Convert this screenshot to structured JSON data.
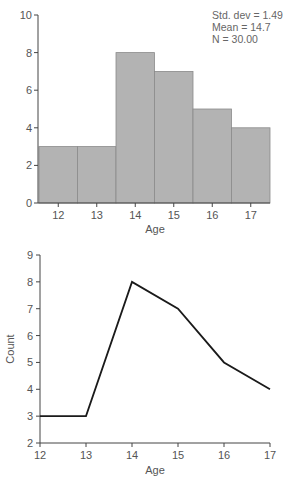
{
  "chart_data": [
    {
      "type": "bar",
      "subtype": "histogram",
      "categories": [
        "12",
        "13",
        "14",
        "15",
        "16",
        "17"
      ],
      "values": [
        3,
        3,
        8,
        7,
        5,
        4
      ],
      "title": "",
      "xlabel": "Age",
      "ylabel": "",
      "ylim": [
        0,
        10
      ],
      "yticks": [
        0,
        2,
        4,
        6,
        8,
        10
      ],
      "xticks": [
        12,
        13,
        14,
        15,
        16,
        17
      ],
      "bar_color": "#b3b3b3",
      "grid": false,
      "annotations": {
        "placement": "top-right",
        "lines": [
          "Std. dev = 1.49",
          "Mean = 14.7",
          "N = 30.00"
        ]
      }
    },
    {
      "type": "line",
      "x": [
        12,
        13,
        14,
        15,
        16,
        17
      ],
      "values": [
        3,
        3,
        8,
        7,
        5,
        4
      ],
      "title": "",
      "xlabel": "Age",
      "ylabel": "Count",
      "xlim": [
        12,
        17
      ],
      "ylim": [
        2,
        9
      ],
      "yticks": [
        2,
        3,
        4,
        5,
        6,
        7,
        8,
        9
      ],
      "xticks": [
        12,
        13,
        14,
        15,
        16,
        17
      ],
      "line_color": "#1a1a1a",
      "grid": false
    }
  ]
}
